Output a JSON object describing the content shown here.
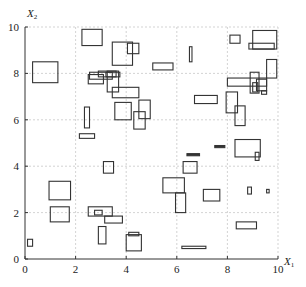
{
  "chart_data": {
    "type": "scatter",
    "subtype": "rectangles",
    "title": "",
    "xlabel": "X1",
    "ylabel": "X2",
    "xlabel_main": "X",
    "xlabel_sub": "1",
    "ylabel_main": "X",
    "ylabel_sub": "2",
    "xlim": [
      0,
      10
    ],
    "ylim": [
      0,
      10
    ],
    "x_ticks": [
      0,
      2,
      4,
      6,
      8,
      10
    ],
    "y_ticks": [
      0,
      2,
      4,
      6,
      8,
      10
    ],
    "x_tick_labels": [
      "0",
      "2",
      "4",
      "6",
      "8",
      "10"
    ],
    "y_tick_labels": [
      "0",
      "2",
      "4",
      "6",
      "8",
      "10"
    ],
    "grid": true,
    "legend": null,
    "rectangles": [
      {
        "x0": 0.3,
        "x1": 1.3,
        "y0": 7.6,
        "y1": 8.5
      },
      {
        "x0": 2.25,
        "x1": 3.05,
        "y0": 9.2,
        "y1": 9.9
      },
      {
        "x0": 3.45,
        "x1": 4.25,
        "y0": 8.35,
        "y1": 9.35
      },
      {
        "x0": 4.05,
        "x1": 4.5,
        "y0": 8.85,
        "y1": 9.3
      },
      {
        "x0": 2.5,
        "x1": 3.1,
        "y0": 7.55,
        "y1": 7.95
      },
      {
        "x0": 2.55,
        "x1": 3.45,
        "y0": 7.75,
        "y1": 8.05
      },
      {
        "x0": 2.9,
        "x1": 3.6,
        "y0": 7.85,
        "y1": 8.1
      },
      {
        "x0": 3.2,
        "x1": 3.75,
        "y0": 7.85,
        "y1": 8.05
      },
      {
        "x0": 3.25,
        "x1": 3.7,
        "y0": 7.2,
        "y1": 8.1
      },
      {
        "x0": 3.45,
        "x1": 4.5,
        "y0": 6.95,
        "y1": 7.4
      },
      {
        "x0": 3.55,
        "x1": 4.2,
        "y0": 6.0,
        "y1": 6.75
      },
      {
        "x0": 4.5,
        "x1": 4.95,
        "y0": 6.05,
        "y1": 6.85
      },
      {
        "x0": 4.3,
        "x1": 4.75,
        "y0": 5.6,
        "y1": 6.35
      },
      {
        "x0": 2.35,
        "x1": 2.55,
        "y0": 5.65,
        "y1": 6.55
      },
      {
        "x0": 2.15,
        "x1": 2.75,
        "y0": 5.2,
        "y1": 5.4
      },
      {
        "x0": 5.05,
        "x1": 5.85,
        "y0": 8.15,
        "y1": 8.45
      },
      {
        "x0": 6.5,
        "x1": 6.6,
        "y0": 8.5,
        "y1": 9.15
      },
      {
        "x0": 6.7,
        "x1": 7.6,
        "y0": 6.7,
        "y1": 7.05
      },
      {
        "x0": 8.1,
        "x1": 8.5,
        "y0": 9.3,
        "y1": 9.65
      },
      {
        "x0": 9.0,
        "x1": 9.95,
        "y0": 9.05,
        "y1": 9.85
      },
      {
        "x0": 8.85,
        "x1": 9.85,
        "y0": 9.05,
        "y1": 9.3
      },
      {
        "x0": 9.55,
        "x1": 9.95,
        "y0": 7.8,
        "y1": 8.6
      },
      {
        "x0": 8.0,
        "x1": 9.55,
        "y0": 7.45,
        "y1": 7.8
      },
      {
        "x0": 8.9,
        "x1": 9.25,
        "y0": 7.15,
        "y1": 8.05
      },
      {
        "x0": 9.0,
        "x1": 9.2,
        "y0": 7.2,
        "y1": 7.6
      },
      {
        "x0": 9.15,
        "x1": 9.55,
        "y0": 7.25,
        "y1": 7.75
      },
      {
        "x0": 9.35,
        "x1": 9.55,
        "y0": 7.1,
        "y1": 7.25
      },
      {
        "x0": 7.95,
        "x1": 8.4,
        "y0": 6.3,
        "y1": 7.2
      },
      {
        "x0": 8.3,
        "x1": 8.7,
        "y0": 5.75,
        "y1": 6.6
      },
      {
        "x0": 8.3,
        "x1": 9.3,
        "y0": 4.4,
        "y1": 5.15
      },
      {
        "x0": 9.1,
        "x1": 9.25,
        "y0": 4.25,
        "y1": 4.6
      },
      {
        "x0": 3.1,
        "x1": 3.5,
        "y0": 3.7,
        "y1": 4.2
      },
      {
        "x0": 0.95,
        "x1": 1.8,
        "y0": 2.55,
        "y1": 3.35
      },
      {
        "x0": 1.0,
        "x1": 1.75,
        "y0": 1.6,
        "y1": 2.25
      },
      {
        "x0": 2.5,
        "x1": 3.45,
        "y0": 1.85,
        "y1": 2.25
      },
      {
        "x0": 2.75,
        "x1": 3.05,
        "y0": 1.9,
        "y1": 2.1
      },
      {
        "x0": 3.15,
        "x1": 3.85,
        "y0": 1.55,
        "y1": 1.85
      },
      {
        "x0": 2.9,
        "x1": 3.2,
        "y0": 0.65,
        "y1": 1.4
      },
      {
        "x0": 4.0,
        "x1": 4.6,
        "y0": 0.35,
        "y1": 1.05
      },
      {
        "x0": 4.1,
        "x1": 4.5,
        "y0": 1.0,
        "y1": 1.15
      },
      {
        "x0": 0.1,
        "x1": 0.3,
        "y0": 0.55,
        "y1": 0.85
      },
      {
        "x0": 5.45,
        "x1": 6.3,
        "y0": 2.85,
        "y1": 3.5
      },
      {
        "x0": 5.95,
        "x1": 6.35,
        "y0": 2.0,
        "y1": 2.85
      },
      {
        "x0": 6.25,
        "x1": 6.8,
        "y0": 3.7,
        "y1": 4.2
      },
      {
        "x0": 7.05,
        "x1": 7.7,
        "y0": 2.5,
        "y1": 3.0
      },
      {
        "x0": 8.8,
        "x1": 8.95,
        "y0": 2.8,
        "y1": 3.1
      },
      {
        "x0": 9.55,
        "x1": 9.65,
        "y0": 2.85,
        "y1": 3.0
      },
      {
        "x0": 8.35,
        "x1": 9.15,
        "y0": 1.3,
        "y1": 1.6
      },
      {
        "x0": 6.2,
        "x1": 7.15,
        "y0": 0.45,
        "y1": 0.55
      }
    ],
    "filled_segments": [
      {
        "x0": 6.4,
        "x1": 6.9,
        "y": 4.5
      },
      {
        "x0": 7.5,
        "x1": 7.9,
        "y": 4.85
      }
    ]
  }
}
